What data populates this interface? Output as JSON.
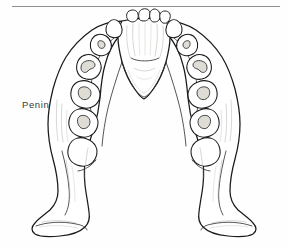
{
  "figure": {
    "specimen_label": "Peninj",
    "view": "occlusal view of hominin mandible line drawing",
    "top_rule": "horizontal-divider-rule",
    "colors": {
      "background": "#fefefe",
      "outline": "#1a1a1a",
      "inner_line": "#2b2b2b",
      "shading": "#b9b5ae",
      "wear_facet": "#dfdcd6",
      "rule": "#8d8d8d",
      "label_text": "#3a3a3a"
    },
    "anatomy": {
      "left_side": [
        "incisors",
        "canine",
        "third-premolar",
        "fourth-premolar",
        "first-molar",
        "second-molar",
        "third-molar",
        "ramus",
        "gonial-angle"
      ],
      "right_side": [
        "incisors",
        "canine",
        "third-premolar",
        "fourth-premolar",
        "first-molar",
        "second-molar",
        "third-molar",
        "ramus",
        "gonial-angle"
      ],
      "midline": [
        "symphysis",
        "dental-arcade-interior"
      ],
      "incisor_count": 4,
      "canine_count": 2,
      "postcanine_per_side": 5
    }
  }
}
